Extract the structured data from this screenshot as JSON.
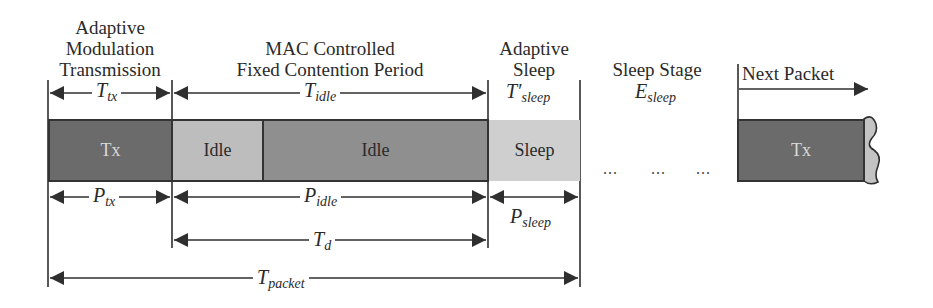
{
  "headers": {
    "adaptive_modulation": [
      "Adaptive",
      "Modulation",
      "Transmission"
    ],
    "mac_controlled": [
      "MAC Controlled",
      "Fixed Contention Period"
    ],
    "adaptive_sleep": [
      "Adaptive",
      "Sleep"
    ],
    "sleep_stage": "Sleep Stage",
    "next_packet": "Next Packet"
  },
  "symbols": {
    "t_tx": {
      "base": "T",
      "sub": "tx"
    },
    "t_idle": {
      "base": "T",
      "sub": "idle"
    },
    "t_sleep_prime": {
      "base": "T′",
      "sub": "sleep"
    },
    "e_sleep": {
      "base": "E",
      "sub": "sleep"
    },
    "p_tx": {
      "base": "P",
      "sub": "tx"
    },
    "p_idle": {
      "base": "P",
      "sub": "idle"
    },
    "p_sleep": {
      "base": "P",
      "sub": "sleep"
    },
    "t_d": {
      "base": "T",
      "sub": "d"
    },
    "t_packet": {
      "base": "T",
      "sub": "packet"
    }
  },
  "boxes": {
    "tx": "Tx",
    "idle_1": "Idle",
    "idle_2": "Idle",
    "sleep": "Sleep",
    "next_tx": "Tx"
  },
  "ellipses": [
    "...",
    "...",
    "..."
  ],
  "colors": {
    "tx_fill": "#6b6b6b",
    "idle_light_fill": "#bdbdbd",
    "idle_dark_fill": "#8f8f8f",
    "sleep_fill": "#cfcfcf",
    "line": "#2f2f2f",
    "tx_text": "#d8d8d8"
  }
}
